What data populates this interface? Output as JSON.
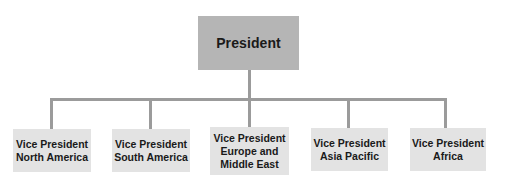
{
  "diagram": {
    "type": "org-chart",
    "colors": {
      "top_box": "#b5b5b5",
      "child_box": "#e3e3e3",
      "connector": "#9b9b9b",
      "text": "#1a1a1a"
    },
    "root": {
      "label": "President"
    },
    "children": [
      {
        "label_line1": "Vice President",
        "label_line2": "North America"
      },
      {
        "label_line1": "Vice President",
        "label_line2": "South America"
      },
      {
        "label_line1": "Vice President",
        "label_line2": "Europe and",
        "label_line3": "Middle East"
      },
      {
        "label_line1": "Vice President",
        "label_line2": "Asia Pacific"
      },
      {
        "label_line1": "Vice President",
        "label_line2": "Africa"
      }
    ]
  }
}
